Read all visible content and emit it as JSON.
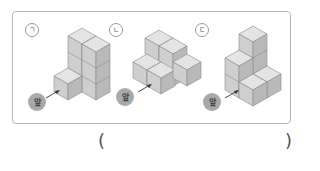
{
  "figures": [
    {
      "id": "ga",
      "label": "ㄱ",
      "front_label": "앞",
      "cube_count": 7
    },
    {
      "id": "na",
      "label": "ㄴ",
      "front_label": "앞",
      "cube_count": 7
    },
    {
      "id": "da",
      "label": "ㄷ",
      "front_label": "앞",
      "cube_count": 8
    }
  ],
  "answer": {
    "open_paren": "(",
    "close_paren": ")",
    "value": ""
  },
  "colors": {
    "cube_top": "#e4e4e4",
    "cube_left": "#cfcfcf",
    "cube_right": "#b9b9b9",
    "cube_edge": "#8a8a8a",
    "badge": "#a9a9a9",
    "frame_border": "#b8b8b8"
  }
}
